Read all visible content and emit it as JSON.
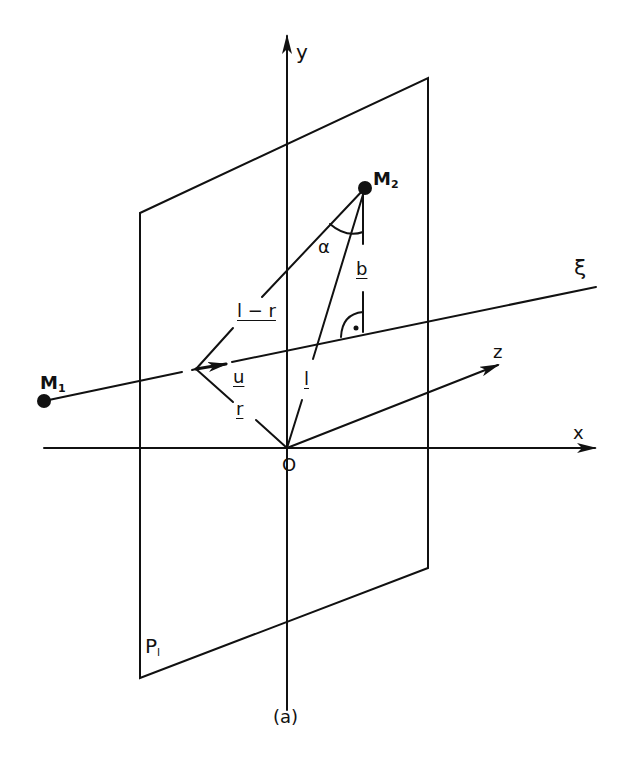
{
  "colors": {
    "ink": "#111111",
    "background": "#ffffff"
  },
  "labels": {
    "y_axis": "y",
    "x_axis": "x",
    "z_axis": "z",
    "origin": "O",
    "xi_line": "ξ",
    "plane": "P",
    "plane_sub": "l",
    "point_m2": "M",
    "point_m2_sub": "2",
    "point_m1": "M",
    "point_m1_sub": "1",
    "alpha": "α",
    "vec_b": "b",
    "vec_l_minus_r": "l − r",
    "vec_u": "u",
    "vec_r": "r",
    "vec_l": "l",
    "caption": "(a)"
  }
}
